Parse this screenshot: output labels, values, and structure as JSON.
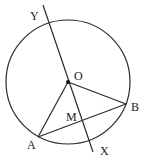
{
  "diagram": {
    "type": "circle-geometry",
    "circle": {
      "cx": 68,
      "cy": 82,
      "r": 62
    },
    "points": {
      "O": {
        "label": "O",
        "x": 68,
        "y": 82
      },
      "A": {
        "label": "A",
        "x": 38,
        "y": 137
      },
      "B": {
        "label": "B",
        "x": 126,
        "y": 104
      },
      "M": {
        "label": "M",
        "x": 81,
        "y": 119
      },
      "X": {
        "label": "X",
        "x": 93,
        "y": 152
      },
      "Y": {
        "label": "Y",
        "x": 43,
        "y": 5
      }
    },
    "segments": [
      {
        "from": "Y",
        "to": "X",
        "name": "line XY"
      },
      {
        "from": "O",
        "to": "A",
        "name": "radius OA"
      },
      {
        "from": "O",
        "to": "B",
        "name": "radius OB"
      },
      {
        "from": "A",
        "to": "B",
        "name": "chord AB"
      }
    ]
  }
}
